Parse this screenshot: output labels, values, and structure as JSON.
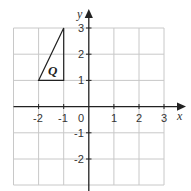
{
  "diagram": {
    "type": "coordinate-grid",
    "x_range": [
      -3,
      3
    ],
    "y_range": [
      -3,
      3
    ],
    "x_axis_label": "x",
    "y_axis_label": "y",
    "x_ticks": [
      "-2",
      "-1",
      "1",
      "2",
      "3"
    ],
    "y_ticks": [
      "3",
      "2",
      "1",
      "-1",
      "-2"
    ],
    "origin_label": "0",
    "shape": {
      "label": "Q",
      "vertices": [
        [
          -2,
          1
        ],
        [
          -1,
          1
        ],
        [
          -1,
          3
        ]
      ]
    },
    "colors": {
      "grid": "#c8c8c8",
      "axis": "#222222",
      "shape": "#222222"
    }
  }
}
